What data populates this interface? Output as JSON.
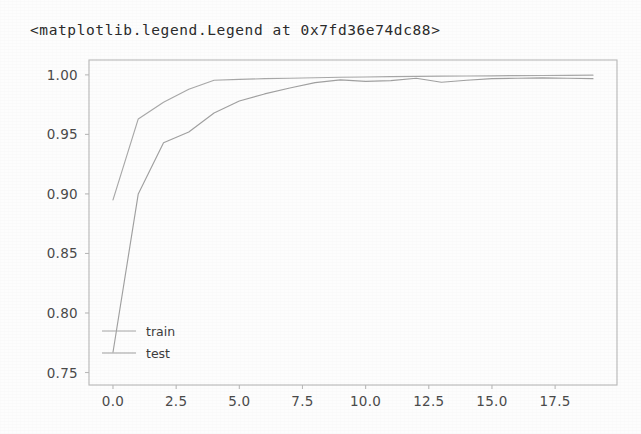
{
  "output_repr": "<matplotlib.legend.Legend at 0x7fd36e74dc88>",
  "figure": {
    "legend": {
      "entries": [
        {
          "label": "train",
          "color": "#a8a8a8"
        },
        {
          "label": "test",
          "color": "#a0a0a0"
        }
      ],
      "location": "lower left",
      "frame_on": false
    }
  },
  "chart_data": {
    "type": "line",
    "title": "",
    "xlabel": "",
    "ylabel": "",
    "xlim": [
      -0.95,
      19.95
    ],
    "ylim": [
      0.7395,
      1.0125
    ],
    "xticks": [
      "0.0",
      "2.5",
      "5.0",
      "7.5",
      "10.0",
      "12.5",
      "15.0",
      "17.5"
    ],
    "xtick_values": [
      0.0,
      2.5,
      5.0,
      7.5,
      10.0,
      12.5,
      15.0,
      17.5
    ],
    "yticks": [
      "0.75",
      "0.80",
      "0.85",
      "0.90",
      "0.95",
      "1.00"
    ],
    "ytick_values": [
      0.75,
      0.8,
      0.85,
      0.9,
      0.95,
      1.0
    ],
    "grid": false,
    "legend_position": "lower left",
    "x": [
      0,
      1,
      2,
      3,
      4,
      5,
      6,
      7,
      8,
      9,
      10,
      11,
      12,
      13,
      14,
      15,
      16,
      17,
      18,
      19
    ],
    "series": [
      {
        "name": "train",
        "color": "#a8a8a8",
        "values": [
          0.895,
          0.963,
          0.977,
          0.988,
          0.9955,
          0.9962,
          0.9968,
          0.9972,
          0.9976,
          0.998,
          0.9982,
          0.9985,
          0.9988,
          0.999,
          0.9991,
          0.9992,
          0.9994,
          0.9995,
          0.9996,
          0.9998
        ]
      },
      {
        "name": "test",
        "color": "#a0a0a0",
        "values": [
          0.767,
          0.9,
          0.943,
          0.952,
          0.968,
          0.978,
          0.984,
          0.989,
          0.9935,
          0.9958,
          0.9945,
          0.9952,
          0.9972,
          0.9938,
          0.9955,
          0.9968,
          0.9972,
          0.9975,
          0.9972,
          0.9968
        ]
      }
    ]
  }
}
